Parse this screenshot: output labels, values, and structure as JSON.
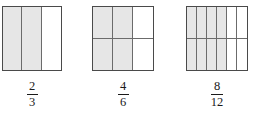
{
  "figure": {
    "background_color": "#ffffff",
    "shade_color": "#e6e6e6",
    "outline_color": "#4a4a4a",
    "divider_color": "#6b6b6b",
    "text_color": "#1a1a1a",
    "models": [
      {
        "id": "model-1",
        "left": 2,
        "top": 6,
        "width": 60,
        "height": 65,
        "columns": 3,
        "rows": 1,
        "total_parts": 3,
        "shaded_parts": 2,
        "shaded_cells": [
          0,
          1
        ],
        "fraction": {
          "numerator": "2",
          "denominator": "3",
          "label": "2/3"
        }
      },
      {
        "id": "model-2",
        "left": 92,
        "top": 6,
        "width": 62,
        "height": 65,
        "columns": 3,
        "rows": 2,
        "total_parts": 6,
        "shaded_parts": 4,
        "shaded_cells": [
          0,
          1,
          3,
          4
        ],
        "fraction": {
          "numerator": "4",
          "denominator": "6",
          "label": "4/6"
        }
      },
      {
        "id": "model-3",
        "left": 186,
        "top": 6,
        "width": 62,
        "height": 65,
        "columns": 6,
        "rows": 2,
        "total_parts": 12,
        "shaded_parts": 8,
        "shaded_cells": [
          0,
          1,
          2,
          3,
          6,
          7,
          8,
          9
        ],
        "fraction": {
          "numerator": "8",
          "denominator": "12",
          "label": "8/12"
        }
      }
    ]
  }
}
